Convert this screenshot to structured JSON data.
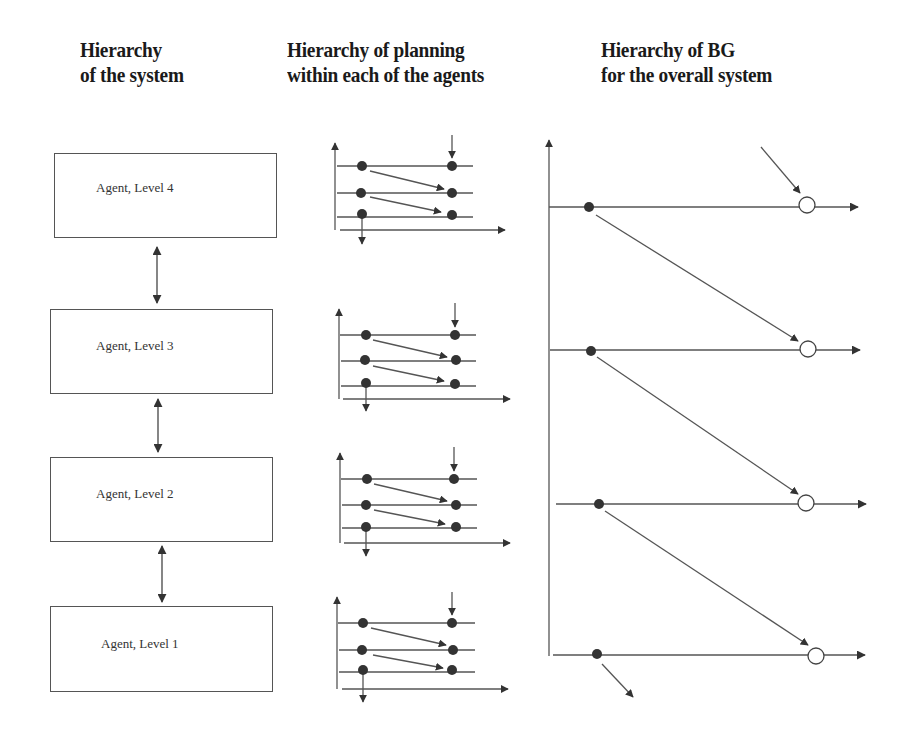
{
  "headings": {
    "col1": {
      "line1": "Hierarchy",
      "line2": "of the system"
    },
    "col2": {
      "line1": "Hierarchy of planning",
      "line2": "within each of the agents"
    },
    "col3": {
      "line1": "Hierarchy of BG",
      "line2": "for the overall system"
    }
  },
  "agents": [
    {
      "label": "Agent, Level 4"
    },
    {
      "label": "Agent, Level 3"
    },
    {
      "label": "Agent, Level 2"
    },
    {
      "label": "Agent, Level 1"
    }
  ],
  "planning_panels": [
    {
      "level": 4,
      "lines": 3
    },
    {
      "level": 3,
      "lines": 3
    },
    {
      "level": 2,
      "lines": 3
    },
    {
      "level": 1,
      "lines": 3
    }
  ],
  "bg_levels": [
    {
      "level": 4,
      "node": "filled-dot",
      "goal": "open-circle"
    },
    {
      "level": 3,
      "node": "filled-dot",
      "goal": "open-circle"
    },
    {
      "level": 2,
      "node": "filled-dot",
      "goal": "open-circle"
    },
    {
      "level": 1,
      "node": "filled-dot",
      "goal": "open-circle"
    }
  ],
  "colors": {
    "line": "#444444",
    "dot": "#333333",
    "box_border": "#555555",
    "text": "#1a1a1a"
  }
}
